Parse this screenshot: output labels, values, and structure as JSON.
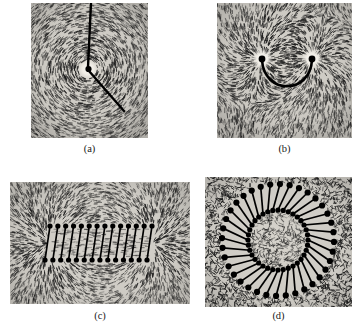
{
  "figure": {
    "background_color": "#ffffff",
    "panel_background": "#d9d6d0",
    "filing_color": "#1b1b1b",
    "wire_color": "#000000",
    "halo_color": "#f4f2ec",
    "panels": [
      {
        "id": "a",
        "caption": "(a)",
        "subject": "straight-current-carrying-wire",
        "description": "Iron filings form concentric circles around a straight wire passing perpendicular through a horizontal plane.",
        "field_pattern": "concentric-circles",
        "center": {
          "x": 57,
          "y": 66
        },
        "wire": {
          "entry_segment": {
            "x1": 60,
            "y1": 0,
            "x2": 57,
            "y2": 64
          },
          "exit_segment": {
            "x1": 58,
            "y1": 68,
            "x2": 92,
            "y2": 107
          },
          "thickness": 2.6
        },
        "halo_radius": 8,
        "filing_count": 2600,
        "ring_count": 16
      },
      {
        "id": "b",
        "caption": "(b)",
        "subject": "current-loop",
        "description": "A U-shaped wire loop; filings fan upward between the two wire ends where the loop pierces the plane.",
        "field_pattern": "loop-dipole",
        "left_node": {
          "x": 45,
          "y": 56
        },
        "right_node": {
          "x": 95,
          "y": 56
        },
        "arc_depth": 38,
        "node_radius": 3.2,
        "halo_radius": 9,
        "filing_count": 2900
      },
      {
        "id": "c",
        "caption": "(c)",
        "subject": "solenoid",
        "description": "A solenoid seen edge-on; field lines run straight through the interior and loop around outside the ends.",
        "field_pattern": "solenoid-dipole",
        "coil_box": {
          "x": 40,
          "y": 44,
          "width": 102,
          "height": 34
        },
        "turns": 14,
        "turn_slant": 5,
        "node_radius": 2.6,
        "filing_count": 3400
      },
      {
        "id": "d",
        "caption": "(d)",
        "subject": "toroid",
        "description": "A toroid; the field is confined inside the ring of windings, leaving the surrounding region nearly empty.",
        "field_pattern": "toroid-confined",
        "center": {
          "x": 73,
          "y": 63
        },
        "inner_radius": 30,
        "outer_radius": 56,
        "turns": 36,
        "turn_slant_deg": 12,
        "node_radius": 2.6,
        "filing_count": 3000
      }
    ]
  }
}
